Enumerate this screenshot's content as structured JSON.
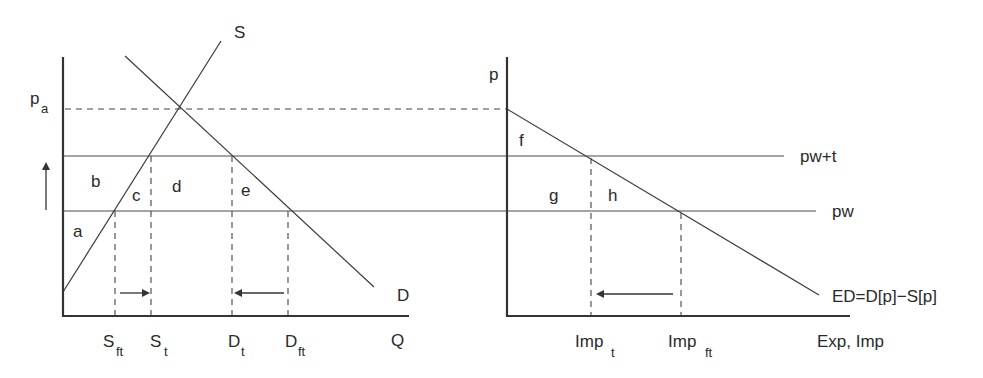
{
  "left_panel": {
    "title": "Domestic market",
    "y_axis_label": "p",
    "y_axis_sub": "a",
    "x_axis_label": "Q",
    "supply_label": "S",
    "demand_label": "D",
    "area_labels": [
      "a",
      "b",
      "c",
      "d",
      "e"
    ],
    "x_ticks": [
      {
        "main": "S",
        "sub": "ft"
      },
      {
        "main": "S",
        "sub": "t"
      },
      {
        "main": "D",
        "sub": "t"
      },
      {
        "main": "D",
        "sub": "ft"
      }
    ],
    "price_up_arrow": "up-arrow"
  },
  "right_panel": {
    "title": "Import market",
    "y_axis_label": "p",
    "x_axis_label": "Exp, Imp",
    "excess_demand_label": "ED=D[p]−S[p]",
    "price_lines": [
      {
        "label": "pw+t"
      },
      {
        "label": "pw"
      }
    ],
    "area_labels": [
      "f",
      "g",
      "h"
    ],
    "x_ticks": [
      {
        "main": "Imp",
        "sub": "t"
      },
      {
        "main": "Imp",
        "sub": "ft"
      }
    ]
  },
  "colors": {
    "line": "#333333",
    "text": "#2a2a2a",
    "background": "#ffffff"
  }
}
